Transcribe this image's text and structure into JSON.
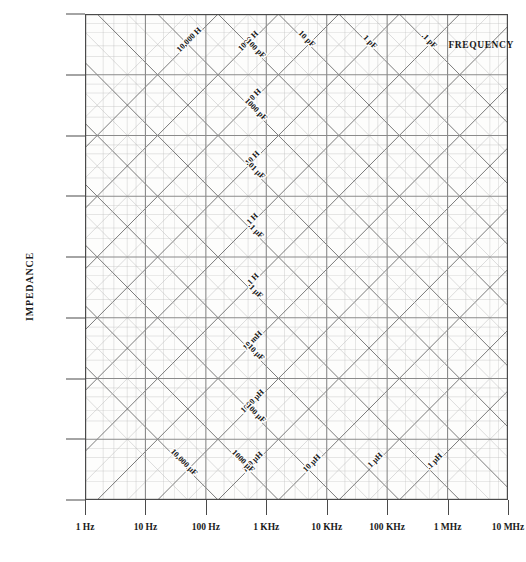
{
  "chart_data": {
    "type": "line",
    "title": "",
    "xlabel": "FREQUENCY",
    "ylabel": "IMPEDANCE",
    "xlim": [
      1,
      10000000
    ],
    "ylim": [
      0.1,
      10000000
    ],
    "xscale": "log",
    "yscale": "log",
    "grid": true,
    "legend": "none",
    "x_ticks": [
      "1 Hz",
      "10 Hz",
      "100 Hz",
      "1 KHz",
      "10 KHz",
      "100 KHz",
      "1 MHz",
      "10 MHz"
    ],
    "x_tick_values": [
      1,
      10,
      100,
      1000,
      10000,
      100000,
      1000000,
      10000000
    ],
    "y_ticks": [
      ".1",
      "1",
      "10",
      "100",
      "1000",
      "10,000",
      "100,000",
      "1 M",
      "10 M"
    ],
    "y_tick_units": [
      "Ω",
      "Ω",
      "Ω",
      "Ω",
      "Ω",
      "Ω",
      "Ω",
      "Ω",
      "Ω"
    ],
    "y_tick_values": [
      0.1,
      1,
      10,
      100,
      1000,
      10000,
      100000,
      1000000,
      10000000
    ],
    "inductance_lines": [
      {
        "label": "10,000 H",
        "henries": 10000
      },
      {
        "label": "1000 H",
        "henries": 1000
      },
      {
        "label": "100 H",
        "henries": 100
      },
      {
        "label": "10 H",
        "henries": 10
      },
      {
        "label": "1 H",
        "henries": 1
      },
      {
        "label": ".1 H",
        "henries": 0.1
      },
      {
        "label": "10 mH",
        "henries": 0.01
      },
      {
        "label": "1000 μH",
        "henries": 0.001
      },
      {
        "label": "100 μH",
        "henries": 0.0001
      },
      {
        "label": "10 μH",
        "henries": 1e-05
      },
      {
        "label": "1 μH",
        "henries": 1e-06
      },
      {
        "label": ".1 μH",
        "henries": 1e-07
      }
    ],
    "capacitance_lines": [
      {
        "label": "10,000 μF",
        "farads": 0.01
      },
      {
        "label": "1000 μF",
        "farads": 0.001
      },
      {
        "label": "100 μF",
        "farads": 0.0001
      },
      {
        "label": "10 μF",
        "farads": 1e-05
      },
      {
        "label": "1 μF",
        "farads": 1e-06
      },
      {
        "label": ".1 μF",
        "farads": 1e-07
      },
      {
        "label": ".01 μF",
        "farads": 1e-08
      },
      {
        "label": "1000 pF",
        "farads": 1e-09
      },
      {
        "label": "100 pF",
        "farads": 1e-10
      },
      {
        "label": "10 pF",
        "farads": 1e-11
      },
      {
        "label": "1 pF",
        "farads": 1e-12
      },
      {
        "label": ".1 pF",
        "farads": 1e-13
      }
    ],
    "colors": {
      "background": "#ffffff",
      "plot_background": "#fdfdfc",
      "major_grid": "#8a8a8a",
      "minor_grid": "#bdbdbd",
      "diagonal_inductive": "#555555",
      "diagonal_capacitive": "#555555",
      "axis": "#4a4a4a",
      "text": "#1a1a1a"
    }
  },
  "axes": {
    "y_title": "IMPEDANCE",
    "x_title": "FREQUENCY",
    "y_labels": [
      {
        "value": "10 M",
        "unit": "Ω"
      },
      {
        "value": "1 M",
        "unit": "Ω"
      },
      {
        "value": "100,000",
        "unit": "Ω"
      },
      {
        "value": "10,000",
        "unit": "Ω"
      },
      {
        "value": "1000",
        "unit": "Ω"
      },
      {
        "value": "100",
        "unit": "Ω"
      },
      {
        "value": "10",
        "unit": "Ω"
      },
      {
        "value": "1",
        "unit": "Ω"
      },
      {
        "value": ".1",
        "unit": "Ω"
      }
    ],
    "x_labels": [
      "1 Hz",
      "10 Hz",
      "100 Hz",
      "1 KHz",
      "10 KHz",
      "100 KHz",
      "1 MHz",
      "10 MHz"
    ]
  }
}
